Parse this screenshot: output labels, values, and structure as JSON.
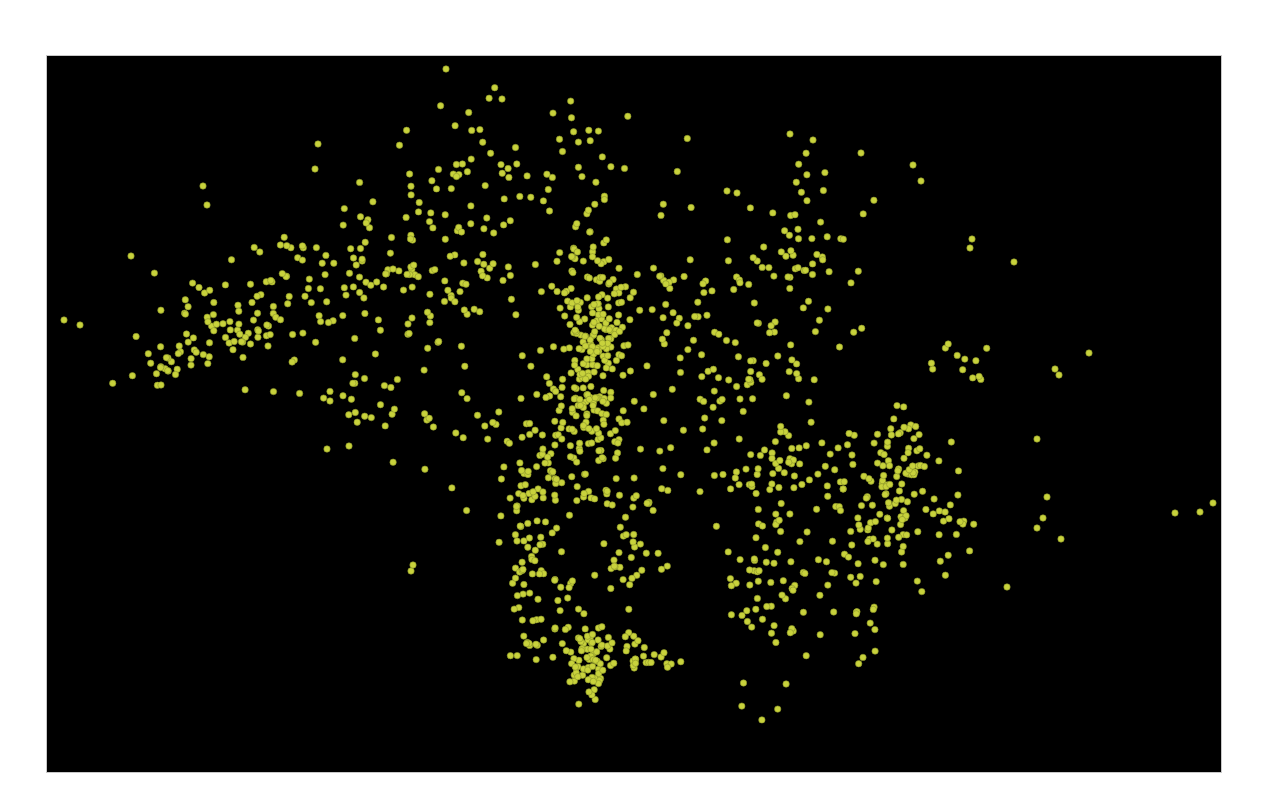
{
  "figure": {
    "background_color": "#000000",
    "point_color": "#c8d23c",
    "point_edge_color": "#8a9428",
    "point_radius": 3.2
  },
  "chart_data": {
    "type": "scatter",
    "title": "",
    "xlabel": "",
    "ylabel": "",
    "grid": false,
    "legend": null,
    "coordinate_space": "pixels within plot frame (1174 x 716), origin top-left",
    "xlim": [
      0,
      1174
    ],
    "ylim": [
      716,
      0
    ],
    "series": [
      {
        "name": "points",
        "color": "#c8d23c",
        "clusters": [
          {
            "cx": 545,
            "cy": 300,
            "sx": 14,
            "sy": 70,
            "n": 170,
            "seed": 11
          },
          {
            "cx": 555,
            "cy": 250,
            "sx": 30,
            "sy": 25,
            "n": 60,
            "seed": 12
          },
          {
            "cx": 520,
            "cy": 390,
            "sx": 35,
            "sy": 50,
            "n": 80,
            "seed": 13
          },
          {
            "cx": 480,
            "cy": 490,
            "sx": 14,
            "sy": 50,
            "n": 55,
            "seed": 14
          },
          {
            "cx": 580,
            "cy": 490,
            "sx": 10,
            "sy": 50,
            "n": 30,
            "seed": 15
          },
          {
            "cx": 540,
            "cy": 610,
            "sx": 10,
            "sy": 25,
            "n": 60,
            "seed": 16
          },
          {
            "cx": 590,
            "cy": 600,
            "sx": 25,
            "sy": 10,
            "n": 35,
            "seed": 17
          },
          {
            "cx": 500,
            "cy": 560,
            "sx": 20,
            "sy": 30,
            "n": 30,
            "seed": 18
          },
          {
            "cx": 190,
            "cy": 275,
            "sx": 40,
            "sy": 22,
            "n": 70,
            "seed": 21
          },
          {
            "cx": 110,
            "cy": 305,
            "sx": 25,
            "sy": 12,
            "n": 20,
            "seed": 22
          },
          {
            "cx": 290,
            "cy": 225,
            "sx": 55,
            "sy": 28,
            "n": 70,
            "seed": 23
          },
          {
            "cx": 400,
            "cy": 215,
            "sx": 45,
            "sy": 35,
            "n": 60,
            "seed": 24
          },
          {
            "cx": 440,
            "cy": 110,
            "sx": 70,
            "sy": 35,
            "n": 70,
            "seed": 25
          },
          {
            "cx": 660,
            "cy": 240,
            "sx": 35,
            "sy": 35,
            "n": 45,
            "seed": 31
          },
          {
            "cx": 760,
            "cy": 210,
            "sx": 30,
            "sy": 50,
            "n": 65,
            "seed": 32
          },
          {
            "cx": 690,
            "cy": 330,
            "sx": 35,
            "sy": 20,
            "n": 30,
            "seed": 33
          },
          {
            "cx": 760,
            "cy": 420,
            "sx": 45,
            "sy": 30,
            "n": 60,
            "seed": 41
          },
          {
            "cx": 830,
            "cy": 440,
            "sx": 25,
            "sy": 25,
            "n": 55,
            "seed": 42
          },
          {
            "cx": 860,
            "cy": 400,
            "sx": 20,
            "sy": 25,
            "n": 35,
            "seed": 43
          },
          {
            "cx": 720,
            "cy": 520,
            "sx": 25,
            "sy": 60,
            "n": 60,
            "seed": 44
          },
          {
            "cx": 800,
            "cy": 530,
            "sx": 30,
            "sy": 35,
            "n": 40,
            "seed": 45
          },
          {
            "cx": 900,
            "cy": 460,
            "sx": 25,
            "sy": 30,
            "n": 25,
            "seed": 46
          },
          {
            "cx": 330,
            "cy": 340,
            "sx": 40,
            "sy": 25,
            "n": 25,
            "seed": 51
          },
          {
            "cx": 430,
            "cy": 350,
            "sx": 45,
            "sy": 60,
            "n": 40,
            "seed": 52
          },
          {
            "cx": 920,
            "cy": 300,
            "sx": 20,
            "sy": 15,
            "n": 12,
            "seed": 61
          },
          {
            "cx": 640,
            "cy": 400,
            "sx": 60,
            "sy": 60,
            "n": 40,
            "seed": 62
          }
        ],
        "outliers": [
          [
            17,
            264
          ],
          [
            33,
            269
          ],
          [
            156,
            130
          ],
          [
            271,
            88
          ],
          [
            268,
            113
          ],
          [
            455,
            43
          ],
          [
            743,
            78
          ],
          [
            766,
            84
          ],
          [
            814,
            97
          ],
          [
            866,
            109
          ],
          [
            874,
            125
          ],
          [
            967,
            206
          ],
          [
            925,
            183
          ],
          [
            923,
            192
          ],
          [
            1042,
            297
          ],
          [
            1153,
            456
          ],
          [
            1128,
            457
          ],
          [
            1166,
            447
          ],
          [
            1012,
            319
          ],
          [
            990,
            383
          ],
          [
            1008,
            313
          ],
          [
            990,
            472
          ],
          [
            996,
            462
          ],
          [
            1000,
            441
          ],
          [
            960,
            531
          ],
          [
            1014,
            483
          ],
          [
            680,
            135
          ],
          [
            690,
            137
          ],
          [
            160,
            149
          ],
          [
            114,
            329
          ],
          [
            364,
            515
          ],
          [
            366,
            509
          ],
          [
            302,
            390
          ],
          [
            280,
            393
          ],
          [
            283,
            345
          ],
          [
            365,
            262
          ],
          [
            361,
            268
          ],
          [
            84,
            200
          ]
        ]
      }
    ]
  }
}
